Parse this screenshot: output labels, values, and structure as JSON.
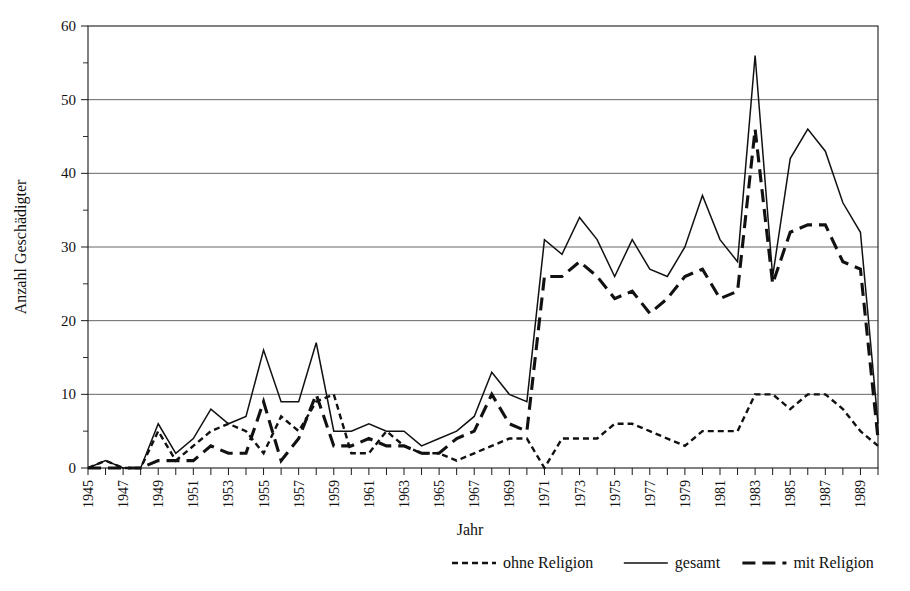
{
  "chart_data": {
    "type": "line",
    "title": "",
    "xlabel": "Jahr",
    "ylabel": "Anzahl Geschädigter",
    "x": [
      1945,
      1946,
      1947,
      1948,
      1949,
      1950,
      1951,
      1952,
      1953,
      1954,
      1955,
      1956,
      1957,
      1958,
      1959,
      1960,
      1961,
      1962,
      1963,
      1964,
      1965,
      1966,
      1967,
      1968,
      1969,
      1970,
      1971,
      1972,
      1973,
      1974,
      1975,
      1976,
      1977,
      1978,
      1979,
      1980,
      1981,
      1982,
      1983,
      1984,
      1985,
      1986,
      1987,
      1988,
      1989,
      1990
    ],
    "xlim": [
      1945,
      1990
    ],
    "ylim": [
      0,
      60
    ],
    "yticks": [
      0,
      10,
      20,
      30,
      40,
      50,
      60
    ],
    "yticks_minor": [
      5,
      15,
      25,
      35,
      45,
      55
    ],
    "xtick_labels": [
      "1945",
      "1947",
      "1949",
      "1951",
      "1953",
      "1955",
      "1957",
      "1959",
      "1961",
      "1963",
      "1965",
      "1967",
      "1969",
      "1971",
      "1973",
      "1975",
      "1977",
      "1979",
      "1981",
      "1983",
      "1985",
      "1987",
      "1989"
    ],
    "grid": "horizontal",
    "legend_position": "below-right",
    "series": [
      {
        "name": "ohne Religion",
        "style": "fine-dashed",
        "values": [
          0,
          1,
          0,
          0,
          5,
          1,
          3,
          5,
          6,
          5,
          2,
          7,
          5,
          9,
          10,
          2,
          2,
          5,
          3,
          2,
          2,
          1,
          2,
          3,
          4,
          4,
          0,
          4,
          4,
          4,
          6,
          6,
          5,
          4,
          3,
          5,
          5,
          5,
          10,
          10,
          8,
          10,
          10,
          8,
          5,
          3
        ]
      },
      {
        "name": "gesamt",
        "style": "solid",
        "values": [
          0,
          1,
          0,
          0,
          6,
          2,
          4,
          8,
          6,
          7,
          16,
          9,
          9,
          17,
          5,
          5,
          6,
          5,
          5,
          3,
          4,
          5,
          7,
          13,
          10,
          9,
          31,
          29,
          34,
          31,
          26,
          31,
          27,
          26,
          30,
          37,
          31,
          28,
          56,
          26,
          42,
          46,
          43,
          36,
          32,
          6
        ]
      },
      {
        "name": "mit Religion",
        "style": "long-dashed",
        "values": [
          0,
          0,
          0,
          0,
          1,
          1,
          1,
          3,
          2,
          2,
          9,
          1,
          4,
          10,
          3,
          3,
          4,
          3,
          3,
          2,
          2,
          4,
          5,
          10,
          6,
          5,
          26,
          26,
          28,
          26,
          23,
          24,
          21,
          23,
          26,
          27,
          23,
          24,
          46,
          25,
          32,
          33,
          33,
          28,
          27,
          4
        ]
      }
    ]
  },
  "axes": {
    "y_title": "Anzahl Geschädigter",
    "x_title": "Jahr",
    "y_tick_labels": [
      "0",
      "10",
      "20",
      "30",
      "40",
      "50",
      "60"
    ]
  },
  "legend": {
    "items": [
      {
        "label": "ohne Religion",
        "style": "fine-dashed"
      },
      {
        "label": "gesamt",
        "style": "solid"
      },
      {
        "label": "mit Religion",
        "style": "long-dashed"
      }
    ]
  },
  "colors": {
    "ink": "#111111",
    "grid": "#555555",
    "background": "#ffffff"
  }
}
